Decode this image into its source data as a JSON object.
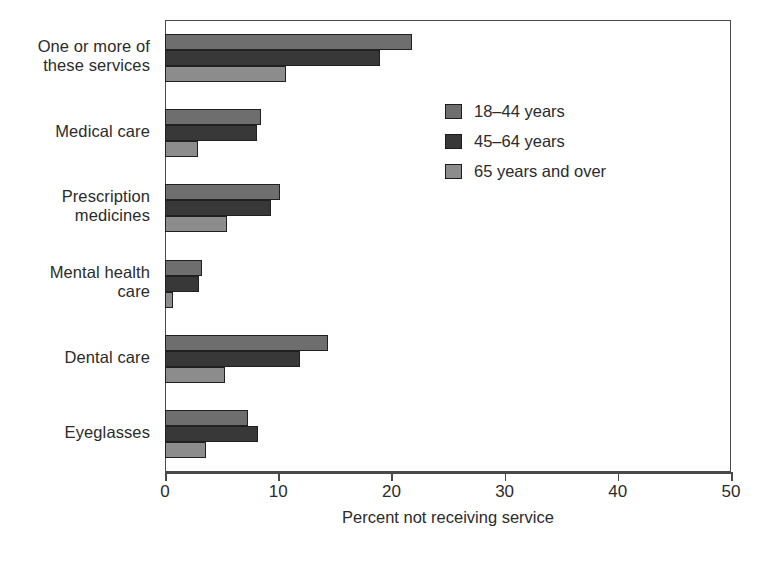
{
  "chart_data": {
    "type": "bar",
    "orientation": "horizontal",
    "title": "",
    "xlabel": "Percent not receiving service",
    "ylabel": "",
    "xlim": [
      0,
      50
    ],
    "xticks": [
      0,
      10,
      20,
      30,
      40,
      50
    ],
    "xtick_labels": [
      "0",
      "10",
      "20",
      "30",
      "40",
      "50"
    ],
    "grid": false,
    "legend_position": "upper right inside plot",
    "categories": [
      "One or more of these services",
      "Medical care",
      "Prescription medicines",
      "Mental health care",
      "Dental care",
      "Eyeglasses"
    ],
    "category_labels": [
      [
        "One or more of",
        "these services"
      ],
      [
        "Medical care"
      ],
      [
        "Prescription",
        "medicines"
      ],
      [
        "Mental health",
        "care"
      ],
      [
        "Dental care"
      ],
      [
        "Eyeglasses"
      ]
    ],
    "series": [
      {
        "name": "18–44 years",
        "color": "#6e6e6e",
        "values": [
          21.8,
          8.5,
          10.2,
          3.3,
          14.4,
          7.3
        ]
      },
      {
        "name": "45–64 years",
        "color": "#383838",
        "values": [
          19.0,
          8.1,
          9.4,
          3.0,
          11.9,
          8.2
        ]
      },
      {
        "name": "65 years and over",
        "color": "#8c8c8c",
        "values": [
          10.7,
          2.9,
          5.5,
          0.7,
          5.3,
          3.6
        ]
      }
    ]
  },
  "legend": {
    "items": [
      {
        "label": "18–44 years",
        "color": "#6e6e6e"
      },
      {
        "label": "45–64 years",
        "color": "#383838"
      },
      {
        "label": "65 years and over",
        "color": "#8c8c8c"
      }
    ]
  },
  "axis": {
    "x_title": "Percent not receiving service",
    "tick_labels": [
      "0",
      "10",
      "20",
      "30",
      "40",
      "50"
    ]
  }
}
